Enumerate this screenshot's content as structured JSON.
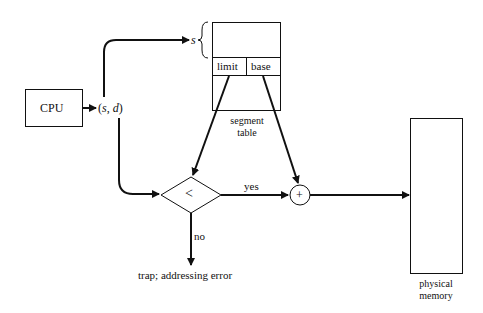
{
  "diagram": {
    "type": "segmentation-hardware",
    "nodes": {
      "cpu": {
        "label": "CPU"
      },
      "logical_address": {
        "label_open": "(",
        "s": "s",
        "comma": ",",
        "d": "d",
        "label_close": ")"
      },
      "segment_selector": {
        "label": "s"
      },
      "segment_table": {
        "label_line1": "segment",
        "label_line2": "table",
        "col_limit": "limit",
        "col_base": "base"
      },
      "compare": {
        "symbol": "<"
      },
      "adder": {
        "symbol": "+"
      },
      "physical_memory": {
        "label_line1": "physical",
        "label_line2": "memory"
      },
      "trap": {
        "label": "trap; addressing error"
      }
    },
    "edges": {
      "yes": "yes",
      "no": "no"
    },
    "colors": {
      "stroke": "#111111",
      "background": "#ffffff"
    }
  }
}
